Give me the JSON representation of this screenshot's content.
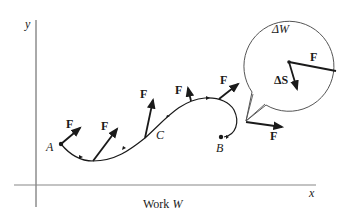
{
  "diagram": {
    "title": "Work W",
    "axes": {
      "x_label": "x",
      "y_label": "y"
    },
    "points": {
      "start": "A",
      "end": "B",
      "middle": "C"
    },
    "force_label": "F",
    "inset": {
      "work_element_label": "ΔW",
      "displacement_label": "ΔS",
      "force_label": "F"
    },
    "colors": {
      "ink": "#1a1a1a",
      "axis": "#555555"
    }
  }
}
